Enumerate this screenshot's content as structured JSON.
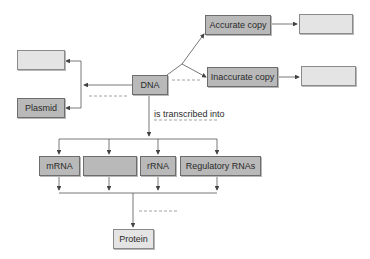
{
  "diagram": {
    "central_node": "DNA",
    "left_branch": {
      "top_blank": "",
      "bottom": "Plasmid"
    },
    "right_branch": {
      "top": "Accurate copy",
      "top_result_blank": "",
      "bottom": "Inaccurate copy",
      "bottom_result_blank": ""
    },
    "transcription_label": "is transcribed into",
    "rna_types": [
      "mRNA",
      "",
      "rRNA",
      "Regulatory RNAs"
    ],
    "final_node": "Protein",
    "colors": {
      "filled_box": "#b9b9b9",
      "blank_box": "#e4e4e4",
      "line": "#555555",
      "dashed": "#888888"
    }
  }
}
